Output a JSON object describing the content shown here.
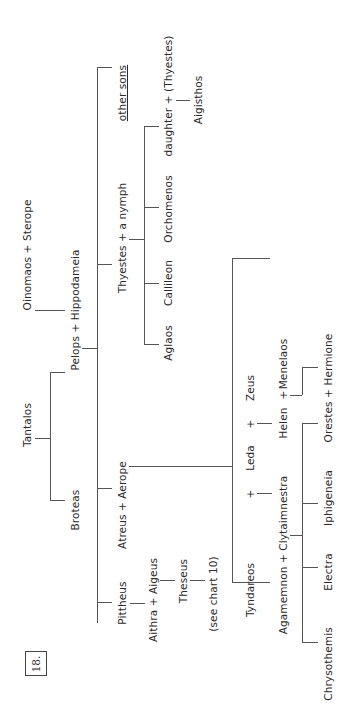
{
  "chart": {
    "number": "18.",
    "orientation": "rotated 90deg counter-clockwise"
  },
  "people": {
    "tantalos": "Tantalos",
    "oinomaos_sterope": "Oinomaos + Sterope",
    "broteas": "Broteas",
    "pelops_hippodameia": "Pelops + Hippodameia",
    "pittheus": "Pittheus",
    "atreus_aerope": "Atreus + Aerope",
    "thyestes_nymph": "Thyestes + a nymph",
    "other_sons": "other sons",
    "aithra_aigeus": "Aithra + Aigeus",
    "theseus": "Theseus",
    "see_chart": "(see chart 10)",
    "aglaos": "Aglaos",
    "callileon": "Callileon",
    "orchomenos": "Orchomenos",
    "daughter_thyestes": "daughter + (Thyestes)",
    "aigisthos": "Aigisthos",
    "tyndareos": "Tyndareos",
    "plus1": "+",
    "leda": "Leda",
    "plus2": "+",
    "zeus": "Zeus",
    "agamemnon_clytaimnestra": "Agamemnon + Clytaimnestra",
    "helen": "Helen",
    "plus3": "+",
    "menelaos": "Menelaos",
    "chrysothemis": "Chrysothemis",
    "electra": "Electra",
    "iphigeneia": "Iphigeneia",
    "orestes_hermione": "Orestes + Hermione"
  },
  "tree": {
    "Tantalos": [
      "Broteas",
      "Pelops"
    ],
    "Oinomaos + Sterope": [
      "Hippodameia"
    ],
    "Pelops + Hippodameia": [
      "Pittheus",
      "Atreus",
      "Thyestes",
      "other sons"
    ],
    "Pittheus": [
      "Aithra"
    ],
    "Aithra + Aigeus": [
      "Theseus"
    ],
    "Theseus": [
      "(see chart 10)"
    ],
    "Atreus + Aerope": [
      "Agamemnon",
      "Menelaos"
    ],
    "Tyndareos + Leda": [
      "Clytaimnestra"
    ],
    "Leda + Zeus": [
      "Helen"
    ],
    "Thyestes + a nymph": [
      "Aglaos",
      "Callileon",
      "Orchomenos",
      "daughter"
    ],
    "daughter + (Thyestes)": [
      "Aigisthos"
    ],
    "Agamemnon + Clytaimnestra": [
      "Chrysothemis",
      "Electra",
      "Iphigeneia",
      "Orestes"
    ],
    "Helen + Menelaos": [
      "Hermione"
    ]
  }
}
